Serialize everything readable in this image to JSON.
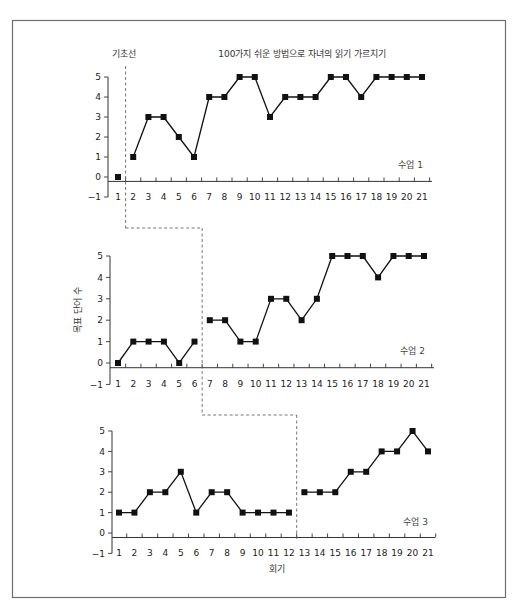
{
  "figure": {
    "baseline_label": "기초선",
    "title": "100가지 쉬운 방법으로 자녀의 읽기 가르치기",
    "ylabel": "목표 단어 수",
    "xlabel": "회기"
  },
  "chart_data": {
    "type": "line",
    "title": "100가지 쉬운 방법으로 자녀의 읽기 가르치기",
    "xlabel": "회기",
    "ylabel": "목표 단어 수",
    "x": [
      1,
      2,
      3,
      4,
      5,
      6,
      7,
      8,
      9,
      10,
      11,
      12,
      13,
      14,
      15,
      16,
      17,
      18,
      19,
      20,
      21
    ],
    "yticks": [
      -1,
      0,
      1,
      2,
      3,
      4,
      5
    ],
    "ylim": [
      -1,
      5
    ],
    "grid": false,
    "legend": "none",
    "phase_labels": [
      "기초선",
      "100가지 쉬운 방법으로 자녀의 읽기 가르치기"
    ],
    "panels": [
      {
        "name": "수업 1",
        "values": [
          0,
          1,
          3,
          3,
          2,
          1,
          4,
          4,
          5,
          5,
          3,
          4,
          4,
          4,
          5,
          5,
          4,
          5,
          5,
          5,
          5
        ],
        "baseline_end_session": 1
      },
      {
        "name": "수업 2",
        "values": [
          0,
          1,
          1,
          1,
          0,
          1,
          2,
          2,
          1,
          1,
          3,
          3,
          2,
          3,
          5,
          5,
          5,
          4,
          5,
          5,
          5
        ],
        "baseline_end_session": 6
      },
      {
        "name": "수업 3",
        "values": [
          1,
          1,
          2,
          2,
          3,
          1,
          2,
          2,
          1,
          1,
          1,
          1,
          2,
          2,
          2,
          3,
          3,
          4,
          4,
          5,
          4
        ],
        "baseline_end_session": 12
      }
    ]
  }
}
